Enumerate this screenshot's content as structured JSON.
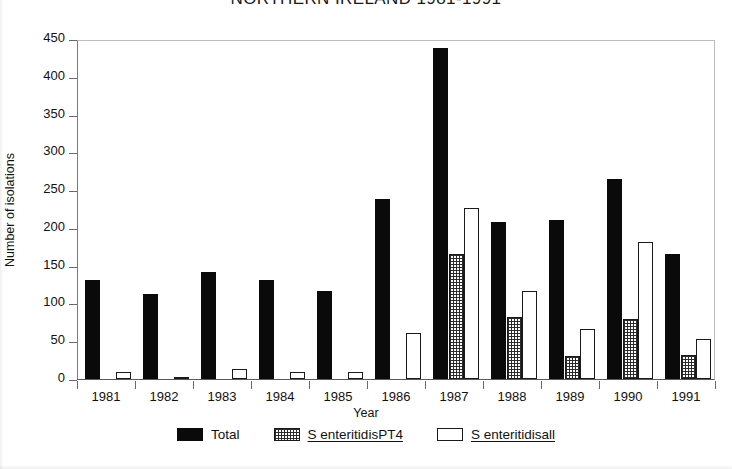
{
  "chart_data": {
    "type": "bar",
    "title": "NORTHERN IRELAND 1981-1991",
    "xlabel": "Year",
    "ylabel": "Number of isolations",
    "categories": [
      "1981",
      "1982",
      "1983",
      "1984",
      "1985",
      "1986",
      "1987",
      "1988",
      "1989",
      "1990",
      "1991"
    ],
    "series": [
      {
        "name": "Total",
        "values": [
          131,
          113,
          142,
          131,
          116,
          238,
          438,
          208,
          211,
          265,
          165
        ]
      },
      {
        "name": "S enteritidisPT4",
        "values": [
          0,
          0,
          0,
          0,
          0,
          0,
          165,
          82,
          30,
          80,
          32
        ]
      },
      {
        "name": "S enteritidisall",
        "values": [
          9,
          1,
          13,
          9,
          9,
          61,
          227,
          117,
          66,
          182,
          53
        ]
      }
    ],
    "ylim": [
      0,
      450
    ],
    "yticks": [
      0,
      50,
      100,
      150,
      200,
      250,
      300,
      350,
      400,
      450
    ],
    "ytick_labels": [
      "0",
      "50",
      "100",
      "150",
      "200",
      "250",
      "300",
      "350",
      "400",
      "450"
    ],
    "grid": false,
    "legend_position": "bottom",
    "legend": [
      {
        "label": "Total",
        "swatch": "solid-black",
        "underlined": false
      },
      {
        "label": "S enteritidisPT4",
        "swatch": "crosshatch",
        "underlined": true
      },
      {
        "label": "S enteritidisall",
        "swatch": "white-outline",
        "underlined": true
      }
    ]
  }
}
